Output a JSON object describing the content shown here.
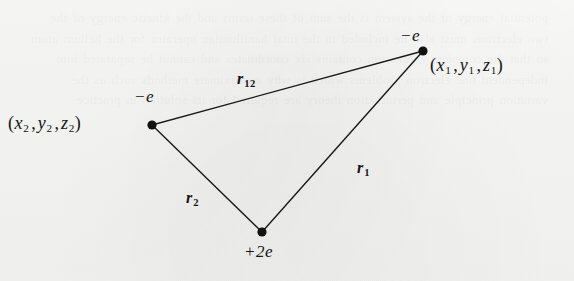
{
  "figure": {
    "background_color": "#f7f7f6",
    "stroke_color": "#1a1a1a",
    "vertices": [
      {
        "id": "electron-1",
        "charge_label": "−e",
        "coord_label": {
          "open": "(",
          "x": "x",
          "x_sub": "1",
          "sep1": ",",
          "y": "y",
          "y_sub": "1",
          "sep2": ",",
          "z": "z",
          "z_sub": "1",
          "close": ")"
        },
        "x": 423,
        "y": 51
      },
      {
        "id": "electron-2",
        "charge_label": "−e",
        "coord_label": {
          "open": "(",
          "x": "x",
          "x_sub": "2",
          "sep1": ",",
          "y": "y",
          "y_sub": "2",
          "sep2": ",",
          "z": "z",
          "z_sub": "2",
          "close": ")"
        },
        "x": 152,
        "y": 125
      },
      {
        "id": "nucleus",
        "charge_label": "+2e",
        "coord_label": null,
        "x": 262,
        "y": 232
      }
    ],
    "edges": [
      {
        "id": "edge-r12",
        "label": "r",
        "label_sub": "12",
        "from": "electron-2",
        "to": "electron-1",
        "label_x": 237,
        "label_y": 71
      },
      {
        "id": "edge-r1",
        "label": "r",
        "label_sub": "1",
        "from": "nucleus",
        "to": "electron-1",
        "label_x": 357,
        "label_y": 160
      },
      {
        "id": "edge-r2",
        "label": "r",
        "label_sub": "2",
        "from": "electron-2",
        "to": "nucleus",
        "label_x": 186,
        "label_y": 190
      }
    ],
    "ghost_text": "potential energy of the system is the sum of these terms and the kinetic energy of the two electrons must also be included in the total hamiltonian operator for the helium atom so that the complete expression contains six coordinates and cannot be separated into independent one electron problems which is why approximate methods such as the variation principle and perturbation theory are required for its solution in practice"
  }
}
